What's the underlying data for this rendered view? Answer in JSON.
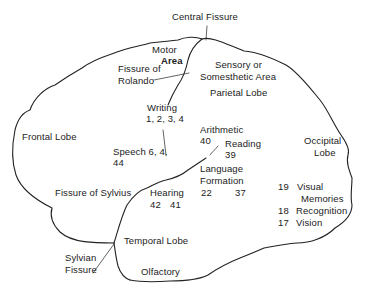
{
  "diagram": {
    "labels": {
      "central_fissure": "Central Fissure",
      "motor": "Motor",
      "area": "Area",
      "fissure_of": "Fissure of",
      "rolando": "Rolando",
      "sensory_or": "Sensory or",
      "somesthetic_area": "Somesthetic Area",
      "parietal_lobe": "Parietal Lobe",
      "writing": "Writing",
      "writing_nums": "1, 2, 3, 4",
      "frontal_lobe": "Frontal Lobe",
      "arithmetic": "Arithmetic",
      "arithmetic_num": "40",
      "reading": "Reading",
      "reading_num": "39",
      "occipital": "Occipital",
      "lobe": "Lobe",
      "speech": "Speech 6, 4,",
      "speech_num": "44",
      "language": "Language",
      "formation": "Formation",
      "language_nums_a": "22",
      "language_nums_b": "37",
      "visual_num": "19",
      "visual": "Visual",
      "memories": "Memories",
      "recognition_num": "18",
      "recognition": "Recognition",
      "vision_num": "17",
      "vision": "Vision",
      "fissure_of_sylvius": "Fissure of Sylvius",
      "hearing": "Hearing",
      "hearing_nums_a": "42",
      "hearing_nums_b": "41",
      "temporal_lobe": "Temporal Lobe",
      "sylvian": "Sylvian",
      "fissure": "Fissure",
      "olfactory": "Olfactory"
    },
    "colors": {
      "ink": "#222222",
      "background": "#ffffff"
    }
  }
}
